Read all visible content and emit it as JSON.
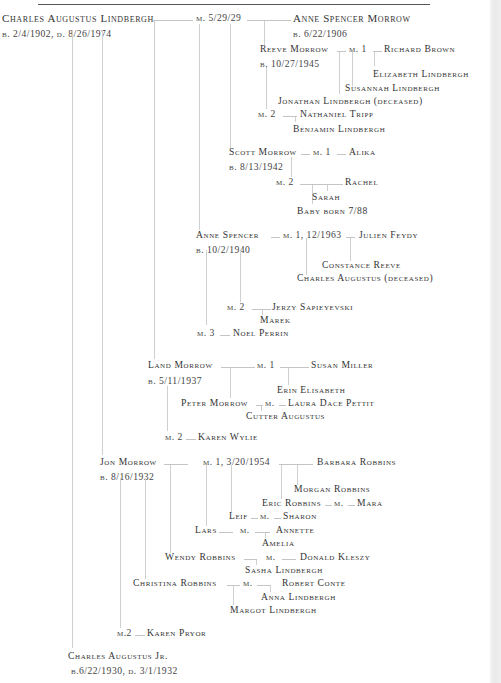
{
  "document": {
    "type": "family-tree",
    "subject": "Lindbergh Family Tree"
  },
  "root": {
    "name": "Charles Augustus Lindbergh",
    "dates": "b. 2/4/1902, d. 8/26/1974",
    "marriage": "m. 5/29/29",
    "spouse": "Anne Spencer Morrow",
    "spouse_dates": "b. 6/22/1906"
  },
  "children": {
    "reeve": {
      "name": "Reeve Morrow",
      "dates": "b. 10/27/1945",
      "m1": "m. 1",
      "m1_spouse": "Richard Brown",
      "m1_children": [
        "Elizabeth Lindbergh",
        "Susannah Lindbergh",
        "Jonathan Lindbergh (deceased)"
      ],
      "m2": "m. 2",
      "m2_spouse": "Nathaniel Tripp",
      "m2_children": [
        "Benjamin Lindbergh"
      ]
    },
    "scott": {
      "name": "Scott Morrow",
      "dates": "b. 8/13/1942",
      "m1": "m. 1",
      "m1_spouse": "Alika",
      "m2": "m. 2",
      "m2_spouse": "Rachel",
      "m2_children": [
        "Sarah",
        "Baby born 7/88"
      ]
    },
    "anne": {
      "name": "Anne Spencer",
      "dates": "b. 10/2/1940",
      "m1": "m. 1, 12/1963",
      "m1_spouse": "Julien Feydy",
      "m1_children": [
        "Constance Reeve",
        "Charles Augustus (deceased)"
      ],
      "m2": "m. 2",
      "m2_spouse": "Jerzy Sapieyevski",
      "m2_children": [
        "Marek"
      ],
      "m3": "m. 3",
      "m3_spouse": "Noel Perrin"
    },
    "land": {
      "name": "Land  Morrow",
      "dates": "b. 5/11/1937",
      "m1": "m. 1",
      "m1_spouse": "Susan Miller",
      "m1_children": [
        "Erin Elisabeth",
        "Peter Morrow"
      ],
      "peter_m": "m.",
      "peter_spouse": "Laura Dace Pettit",
      "peter_children": [
        "Cutter Augustus"
      ],
      "m2": "m. 2",
      "m2_spouse": "Karen Wylie"
    },
    "jon": {
      "name": "Jon Morrow",
      "dates": "b. 8/16/1932",
      "m1": "m. 1, 3/20/1954",
      "m1_spouse": "Barbara Robbins",
      "m1_children": [
        "Morgan Robbins",
        "Eric Robbins",
        "Leif",
        "Lars",
        "Wendy Robbins",
        "Christina Robbins"
      ],
      "eric_m": "m.",
      "eric_spouse": "Mara",
      "leif_m": "m.",
      "leif_spouse": "Sharon",
      "lars_m": "m.",
      "lars_spouse": "Annette",
      "lars_children": [
        "Amelia"
      ],
      "wendy_m": "m.",
      "wendy_spouse": "Donald Kleszy",
      "wendy_children": [
        "Sasha Lindbergh"
      ],
      "christina_m": "m.",
      "christina_spouse": "Robert Conte",
      "christina_children": [
        "Anna Lindbergh",
        "Margot Lindbergh"
      ],
      "m2": "m.2",
      "m2_spouse": "Karen Pryor"
    },
    "charles_jr": {
      "name": "Charles Augustus Jr.",
      "dates": "b.6/22/1930, d. 3/1/1932"
    }
  },
  "colors": {
    "text": "#333333",
    "connector": "#c8c8c8",
    "rule": "#555555",
    "page_edge": "#ebebeb"
  }
}
